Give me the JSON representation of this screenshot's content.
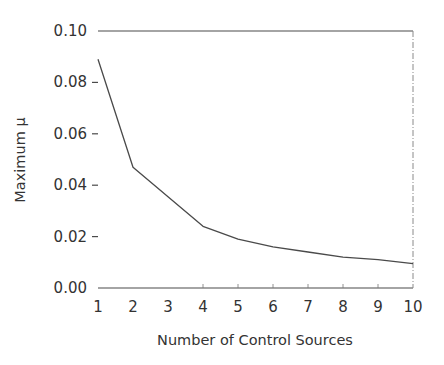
{
  "chart_data": {
    "type": "line",
    "title": "",
    "xlabel": "Number of Control Sources",
    "ylabel": "Maximum  μ",
    "x": [
      1,
      2,
      3,
      4,
      5,
      6,
      7,
      8,
      9,
      10
    ],
    "series": [
      {
        "name": "Maximum mu",
        "values": [
          0.089,
          0.047,
          0.0355,
          0.024,
          0.019,
          0.016,
          0.014,
          0.012,
          0.011,
          0.0095
        ]
      }
    ],
    "xlim": [
      1,
      10
    ],
    "ylim": [
      0.0,
      0.1
    ],
    "xticks": [
      "1",
      "2",
      "3",
      "4",
      "5",
      "6",
      "7",
      "8",
      "9",
      "10"
    ],
    "yticks": [
      "0.00",
      "0.02",
      "0.04",
      "0.06",
      "0.08",
      "0.10"
    ],
    "grid": false,
    "legend": null,
    "line_color": "#4a4a4a"
  }
}
